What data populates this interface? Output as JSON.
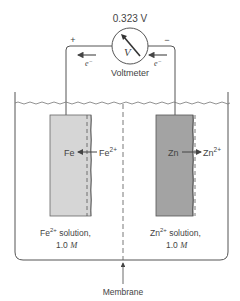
{
  "voltmeter": {
    "reading": "0.323 V",
    "symbol": "V",
    "label": "Voltmeter",
    "positive_sign": "+",
    "negative_sign": "−",
    "electron_left": "e",
    "electron_right": "e",
    "electron_superscript": "−"
  },
  "left_half_cell": {
    "electrode_label": "Fe",
    "ion_label": "Fe",
    "ion_charge": "2+",
    "solution_ion": "Fe",
    "solution_charge": "2+",
    "solution_text": " solution,",
    "concentration_value": "1.0 ",
    "concentration_unit": "M",
    "electrode_color": "#d6d6d6"
  },
  "right_half_cell": {
    "electrode_label": "Zn",
    "ion_label": "Zn",
    "ion_charge": "2+",
    "solution_ion": "Zn",
    "solution_charge": "2+",
    "solution_text": " solution,",
    "concentration_value": "1.0 ",
    "concentration_unit": "M",
    "electrode_color": "#a3a3a3"
  },
  "membrane": {
    "label": "Membrane"
  },
  "colors": {
    "line": "#555555",
    "text": "#444444",
    "fe_electrode": "#d6d6d6",
    "zn_electrode": "#a3a3a3"
  }
}
